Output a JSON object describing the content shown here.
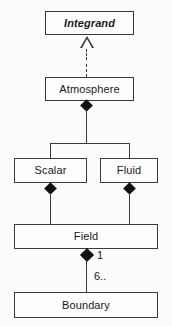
{
  "diagram": {
    "type": "uml-class-diagram",
    "background_color": "#fcfcfc",
    "line_color": "#3a3a3a",
    "fill_color": "#111111",
    "nodes": [
      {
        "id": "integrand",
        "label": "Integrand",
        "stereotype": "abstract"
      },
      {
        "id": "atmosphere",
        "label": "Atmosphere",
        "stereotype": "class"
      },
      {
        "id": "scalar",
        "label": "Scalar",
        "stereotype": "class"
      },
      {
        "id": "fluid",
        "label": "Fluid",
        "stereotype": "class"
      },
      {
        "id": "field",
        "label": "Field",
        "stereotype": "class"
      },
      {
        "id": "boundary",
        "label": "Boundary",
        "stereotype": "class"
      }
    ],
    "edges": [
      {
        "from": "atmosphere",
        "to": "integrand",
        "kind": "realization",
        "line": "dashed",
        "arrow": "hollow-triangle"
      },
      {
        "from": "atmosphere",
        "to": "scalar",
        "kind": "composition",
        "line": "solid",
        "arrow": "filled-diamond"
      },
      {
        "from": "atmosphere",
        "to": "fluid",
        "kind": "composition",
        "line": "solid",
        "arrow": "filled-diamond"
      },
      {
        "from": "scalar",
        "to": "field",
        "kind": "composition",
        "line": "solid",
        "arrow": "filled-diamond"
      },
      {
        "from": "fluid",
        "to": "field",
        "kind": "composition",
        "line": "solid",
        "arrow": "filled-diamond"
      },
      {
        "from": "field",
        "to": "boundary",
        "kind": "composition",
        "line": "solid",
        "arrow": "filled-diamond"
      }
    ],
    "multiplicities": {
      "field_end": "1",
      "boundary_end": "6.."
    }
  }
}
